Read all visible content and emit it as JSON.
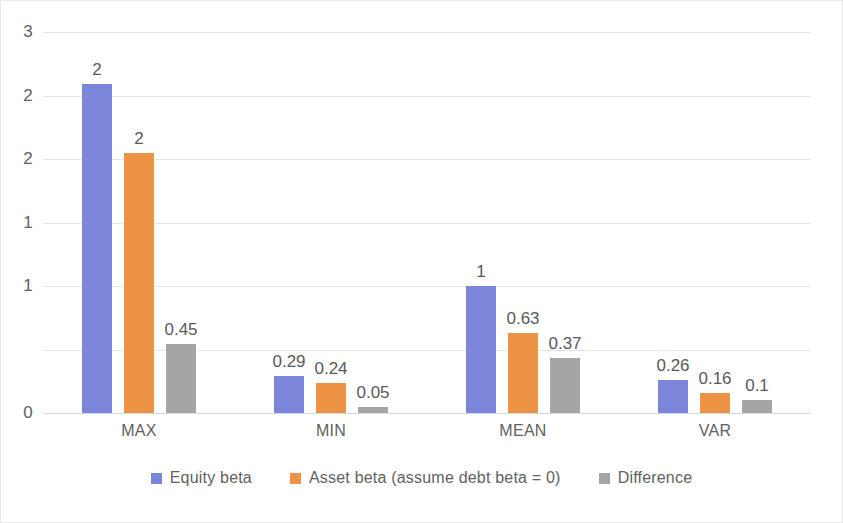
{
  "chart_data": {
    "type": "bar",
    "title": "",
    "subtitle": "",
    "xlabel": "",
    "ylabel": "",
    "categories": [
      "MAX",
      "MIN",
      "MEAN",
      "VAR"
    ],
    "series": [
      {
        "name": "Equity beta",
        "color": "#7b85da",
        "values": [
          2.59,
          0.29,
          1.0,
          0.26
        ],
        "data_labels": [
          "2",
          "0.29",
          "1",
          "0.26"
        ]
      },
      {
        "name": "Asset beta (assume debt beta = 0)",
        "color": "#ed9343",
        "values": [
          2.05,
          0.24,
          0.63,
          0.16
        ],
        "data_labels": [
          "2",
          "0.24",
          "0.63",
          "0.16"
        ]
      },
      {
        "name": "Difference",
        "color": "#a5a5a5",
        "values": [
          0.54,
          0.05,
          0.43,
          0.1
        ],
        "data_labels": [
          "0.45",
          "0.05",
          "0.37",
          "0.1"
        ]
      }
    ],
    "ylim": [
      0,
      3
    ],
    "y_ticks": [
      {
        "value": 3.0,
        "label": "3"
      },
      {
        "value": 2.5,
        "label": "2"
      },
      {
        "value": 2.0,
        "label": "2"
      },
      {
        "value": 1.5,
        "label": "1"
      },
      {
        "value": 1.0,
        "label": "1"
      },
      {
        "value": 0.5,
        "label": ""
      },
      {
        "value": 0.0,
        "label": "0"
      }
    ],
    "grid": true,
    "grid_axis": "y",
    "legend": {
      "position": "bottom",
      "entries": [
        "Equity beta",
        "Asset beta (assume debt beta = 0)",
        "Difference"
      ]
    },
    "colors": {
      "series_1": "#7b85da",
      "series_2": "#ed9343",
      "series_3": "#a5a5a5",
      "gridline": "#e6e6e8",
      "axis_text": "#616161",
      "label_text": "#595959",
      "background": "#ffffff",
      "border": "#e9e9ec"
    }
  }
}
